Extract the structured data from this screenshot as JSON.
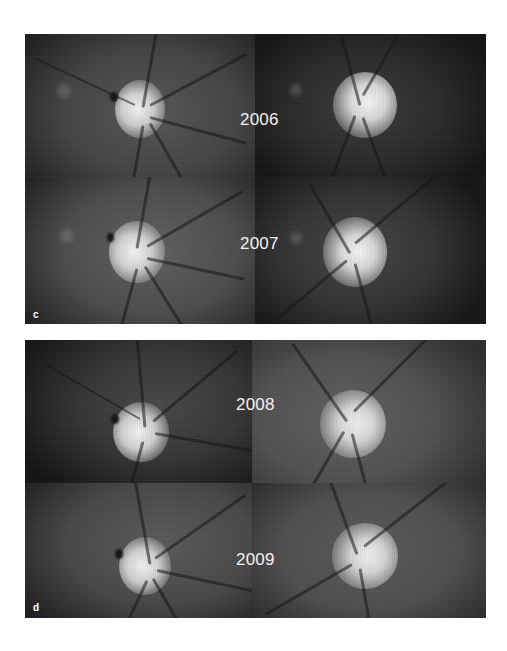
{
  "figure": {
    "panels": [
      {
        "label": "c",
        "rows": [
          {
            "year": "2006",
            "images": [
              {
                "side": "left",
                "background": "#4a4a4a",
                "vignette": "#1c1c1c"
              },
              {
                "side": "right",
                "background": "#2a2a2a",
                "vignette": "#141414"
              }
            ]
          },
          {
            "year": "2007",
            "images": [
              {
                "side": "left",
                "background": "#555555",
                "vignette": "#202020"
              },
              {
                "side": "right",
                "background": "#3a3a3a",
                "vignette": "#161616"
              }
            ]
          }
        ]
      },
      {
        "label": "d",
        "rows": [
          {
            "year": "2008",
            "images": [
              {
                "side": "left",
                "background": "#3a3a3a",
                "vignette": "#141414"
              },
              {
                "side": "right",
                "background": "#5a5a5a",
                "vignette": "#2e2e2e"
              }
            ]
          },
          {
            "year": "2009",
            "images": [
              {
                "side": "left",
                "background": "#505050",
                "vignette": "#1e1e1e"
              },
              {
                "side": "right",
                "background": "#4e4e4e",
                "vignette": "#262626"
              }
            ]
          }
        ]
      }
    ]
  },
  "colors": {
    "page_background": "#ffffff",
    "label_text": "#f2f2f2",
    "disc_bright": "#f0f0f0"
  }
}
